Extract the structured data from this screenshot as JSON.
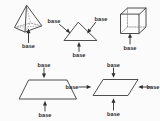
{
  "diagram": {
    "background_color": "#fbfbfb",
    "stroke_color": "#3a3a3a",
    "label_color": "#2b2b2b",
    "label_text": "base",
    "shapes": [
      {
        "id": "pyramid",
        "name": "square-pyramid",
        "label_count": 1,
        "labels": [
          "base"
        ]
      },
      {
        "id": "triangle",
        "name": "triangle",
        "label_count": 3,
        "labels": [
          "base",
          "base",
          "base"
        ]
      },
      {
        "id": "cube",
        "name": "rectangular-prism",
        "label_count": 1,
        "labels": [
          "base"
        ]
      },
      {
        "id": "trapezoid",
        "name": "trapezoid",
        "label_count": 2,
        "labels": [
          "base",
          "base"
        ]
      },
      {
        "id": "parallelogram",
        "name": "parallelogram",
        "label_count": 4,
        "labels": [
          "base",
          "base",
          "base",
          "base"
        ]
      }
    ],
    "labels": {
      "pyramid_bottom": "base",
      "triangle_left": "base",
      "triangle_right": "base",
      "triangle_bottom": "base",
      "cube_bottom": "base",
      "trapezoid_top": "base",
      "trapezoid_bottom": "base",
      "parallelogram_top": "base",
      "parallelogram_left": "base",
      "parallelogram_right": "base",
      "parallelogram_bottom": "base"
    }
  }
}
